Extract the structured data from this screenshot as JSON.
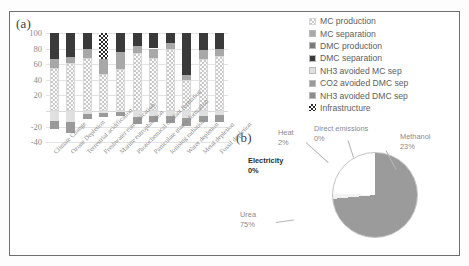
{
  "figure": {
    "panel_a_label": "(a)",
    "panel_b_label": "(b)"
  },
  "legend": {
    "items": [
      {
        "label": "MC production",
        "swatch": "dotted-light",
        "color": "#fbfbfb"
      },
      {
        "label": "MC separation",
        "swatch": "solid",
        "color": "#a8a8a8"
      },
      {
        "label": "DMC production",
        "swatch": "solid",
        "color": "#7a7a7a"
      },
      {
        "label": "DMC separation",
        "swatch": "solid",
        "color": "#3a3a3a"
      },
      {
        "label": "NH3 avoided MC sep",
        "swatch": "solid",
        "color": "#e0e0e0"
      },
      {
        "label": "CO2 avoided DMC sep",
        "swatch": "solid",
        "color": "#9a9a9a"
      },
      {
        "label": "NH3 avoided DMC sep",
        "swatch": "solid",
        "color": "#8d8d8d"
      },
      {
        "label": "Infrastructure",
        "swatch": "dotted-dark",
        "color": "#2b2b2b"
      }
    ]
  },
  "chart_data": [
    {
      "type": "bar",
      "stacked": true,
      "title": "",
      "xlabel": "",
      "ylabel": "",
      "ylim": [
        -45,
        105
      ],
      "yticks": [
        100,
        80,
        60,
        40,
        20,
        -20,
        -40
      ],
      "ytick_labels": [
        "100",
        "80",
        "60",
        "40",
        "20",
        "-20",
        "-40"
      ],
      "grid": true,
      "legend_position": "right",
      "categories": [
        "Climate Change",
        "Ozone Depletion",
        "Terrestrial acidification",
        "Freshwater eutrophication",
        "Marine eutrophication",
        "Photochemical oxidant formation",
        "Particulate matter formation",
        "Ionising radiation",
        "Water depletion",
        "Metal depletion",
        "Fossil depletion"
      ],
      "series": [
        {
          "name": "MC production",
          "values": [
            55,
            61,
            68,
            47,
            54,
            74,
            68,
            79,
            40,
            67,
            70
          ]
        },
        {
          "name": "MC separation",
          "values": [
            12,
            8,
            11,
            20,
            22,
            9,
            12,
            8,
            6,
            11,
            9
          ]
        },
        {
          "name": "DMC production",
          "values": [
            0,
            0,
            0,
            0,
            0,
            0,
            0,
            0,
            0,
            0,
            0
          ]
        },
        {
          "name": "DMC separation",
          "values": [
            33,
            31,
            21,
            0,
            24,
            17,
            20,
            13,
            54,
            22,
            21
          ]
        },
        {
          "name": "Infrastructure",
          "values": [
            0,
            0,
            0,
            33,
            0,
            0,
            0,
            0,
            0,
            0,
            0
          ]
        },
        {
          "name": "NH3 avoided MC sep",
          "values": [
            -13,
            -14,
            -4,
            -3,
            -2,
            -8,
            -6,
            -7,
            -9,
            -6,
            -5
          ]
        },
        {
          "name": "CO2 avoided DMC sep",
          "values": [
            -10,
            -14,
            -7,
            -5,
            -5,
            -9,
            -8,
            -8,
            -10,
            -8,
            -9
          ]
        },
        {
          "name": "NH3 avoided DMC sep",
          "values": [
            0,
            0,
            0,
            0,
            0,
            0,
            0,
            0,
            0,
            0,
            0
          ]
        }
      ]
    },
    {
      "type": "pie",
      "title": "",
      "labels": [
        "Urea",
        "Methanol",
        "Heat",
        "Direct emissions",
        "Electricity"
      ],
      "values": [
        75,
        23,
        2,
        0,
        0
      ],
      "value_labels": [
        "75%",
        "23%",
        "2%",
        "0%",
        "0%"
      ],
      "colors": [
        "#9b9b9b",
        "#d7d7d7",
        "#f2f2f2",
        "#ffffff",
        "#ffffff"
      ],
      "legend_position": "callout-labels"
    }
  ]
}
